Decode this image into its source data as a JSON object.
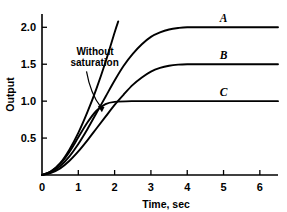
{
  "chart_data": {
    "type": "line",
    "title": "",
    "xlabel": "Time, sec",
    "ylabel": "Output",
    "xlim": [
      0,
      6.5
    ],
    "ylim": [
      0,
      2.18
    ],
    "grid": false,
    "legend_position": "inline-right",
    "xticks": [
      "0",
      "1",
      "2",
      "3",
      "4",
      "5",
      "6"
    ],
    "xtick_values": [
      0,
      1,
      2,
      3,
      4,
      5,
      6
    ],
    "yticks": [
      "0.5",
      "1.0",
      "1.5",
      "2.0"
    ],
    "ytick_values": [
      0.5,
      1.0,
      1.5,
      2.0
    ],
    "annotations": [
      {
        "name": "without-saturation",
        "text_line1": "Without",
        "text_line2": "saturation",
        "points_to_x": 1.65,
        "points_to_y": 0.85
      }
    ],
    "series": [
      {
        "name": "A",
        "label": "A",
        "saturation_level": 2.0,
        "x": [
          0,
          0.25,
          0.5,
          0.75,
          1.0,
          1.25,
          1.5,
          1.75,
          2.0,
          2.25,
          2.5,
          2.75,
          3.0,
          3.25,
          3.5,
          3.75,
          4.0,
          4.5,
          5.0,
          5.5,
          6.0,
          6.5
        ],
        "y": [
          0,
          0.04,
          0.12,
          0.25,
          0.42,
          0.62,
          0.84,
          1.06,
          1.28,
          1.48,
          1.64,
          1.77,
          1.87,
          1.93,
          1.97,
          1.99,
          2.0,
          2.0,
          2.0,
          2.0,
          2.0,
          2.0
        ]
      },
      {
        "name": "B",
        "label": "B",
        "saturation_level": 1.5,
        "x": [
          0,
          0.25,
          0.5,
          0.75,
          1.0,
          1.25,
          1.5,
          1.75,
          2.0,
          2.25,
          2.5,
          2.75,
          3.0,
          3.25,
          3.5,
          3.75,
          4.0,
          4.5,
          5.0,
          5.5,
          6.0,
          6.5
        ],
        "y": [
          0,
          0.03,
          0.09,
          0.19,
          0.32,
          0.47,
          0.63,
          0.79,
          0.95,
          1.09,
          1.22,
          1.32,
          1.4,
          1.45,
          1.48,
          1.495,
          1.5,
          1.5,
          1.5,
          1.5,
          1.5,
          1.5
        ]
      },
      {
        "name": "C",
        "label": "C",
        "saturation_level": 1.0,
        "x": [
          0,
          0.25,
          0.5,
          0.75,
          1.0,
          1.25,
          1.5,
          1.75,
          2.0,
          2.5,
          3.0,
          3.5,
          4.0,
          4.5,
          5.0,
          5.5,
          6.0,
          6.5
        ],
        "y": [
          0,
          0.05,
          0.15,
          0.31,
          0.51,
          0.71,
          0.87,
          0.96,
          0.99,
          1.0,
          1.0,
          1.0,
          1.0,
          1.0,
          1.0,
          1.0,
          1.0,
          1.0
        ]
      },
      {
        "name": "without-saturation-curve",
        "label": "",
        "saturation_level": null,
        "x": [
          0,
          0.25,
          0.5,
          0.75,
          1.0,
          1.25,
          1.5,
          1.75,
          2.0,
          2.1
        ],
        "y": [
          0,
          0.05,
          0.16,
          0.34,
          0.57,
          0.85,
          1.17,
          1.53,
          1.93,
          2.08
        ]
      }
    ]
  },
  "colors": {
    "ink": "#000000",
    "background": "#ffffff"
  }
}
